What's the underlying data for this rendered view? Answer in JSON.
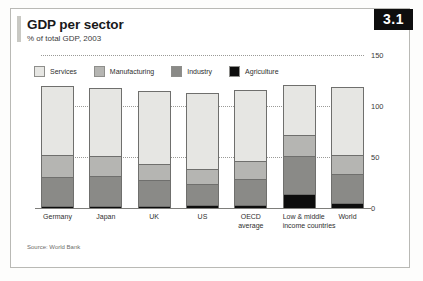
{
  "badge": {
    "number": "3.1"
  },
  "title": "GDP per sector",
  "subtitle": "% of total GDP, 2003",
  "source": "Source: World Bank",
  "colors": {
    "services": "#e6e6e3",
    "manufacturing": "#b5b5b2",
    "industry": "#8a8a87",
    "agriculture": "#0d0d0d",
    "badge_bg": "#0e0e0e",
    "badge_text": "#ffffff",
    "gridline": "#9a9a97",
    "axis": "#7e7e7b"
  },
  "legend": [
    {
      "label": "Services",
      "color": "#e6e6e3",
      "key": "services"
    },
    {
      "label": "Manufacturing",
      "color": "#b5b5b2",
      "key": "manufacturing"
    },
    {
      "label": "Industry",
      "color": "#8a8a87",
      "key": "industry"
    },
    {
      "label": "Agriculture",
      "color": "#0d0d0d",
      "key": "agriculture"
    }
  ],
  "chart_data": {
    "type": "bar",
    "stacked": true,
    "title": "GDP per sector",
    "subtitle": "% of total GDP, 2003",
    "xlabel": "",
    "ylabel": "",
    "ylim": [
      0,
      150
    ],
    "yticks": [
      0,
      50,
      100,
      150
    ],
    "ytick_labels": [
      "0",
      "50",
      "100",
      "150"
    ],
    "grid": true,
    "legend_position": "top-left",
    "source": "Source: World Bank",
    "note": "Segments are stacked; Manufacturing is a component shown above Industry. Totals exceed 100 because manufacturing is counted within industry.",
    "categories": [
      "Germany",
      "Japan",
      "UK",
      "US",
      "OECD average",
      "Low & middle income countries",
      "World"
    ],
    "category_lines": [
      [
        "Germany"
      ],
      [
        "Japan"
      ],
      [
        "UK"
      ],
      [
        "US"
      ],
      [
        "OECD",
        "average"
      ],
      [
        "Low & middle",
        "income countries"
      ],
      [
        "World"
      ]
    ],
    "series": [
      {
        "name": "Agriculture",
        "color": "#0d0d0d",
        "values": [
          1,
          1,
          1,
          2,
          2,
          13,
          4
        ]
      },
      {
        "name": "Industry",
        "color": "#8a8a87",
        "values": [
          28,
          29,
          25,
          21,
          25,
          37,
          28
        ]
      },
      {
        "name": "Manufacturing",
        "color": "#b5b5b2",
        "values": [
          22,
          20,
          16,
          14,
          18,
          21,
          19
        ]
      },
      {
        "name": "Services",
        "color": "#e6e6e3",
        "values": [
          69,
          68,
          73,
          76,
          71,
          50,
          68
        ]
      }
    ],
    "totals": [
      120,
      118,
      115,
      113,
      116,
      121,
      119
    ]
  },
  "axis": {
    "ticks": [
      {
        "value": 150,
        "label": "150"
      },
      {
        "value": 100,
        "label": "100"
      },
      {
        "value": 50,
        "label": "50"
      },
      {
        "value": 0,
        "label": "0"
      }
    ]
  }
}
